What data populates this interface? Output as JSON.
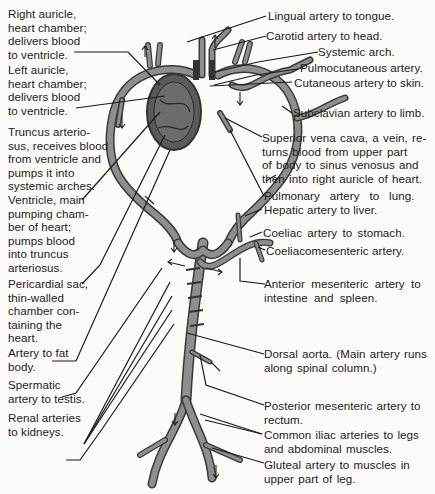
{
  "diagram": {
    "colors": {
      "vessel_outline": "#3a3a3a",
      "vessel_fill": "#8e8e8e",
      "heart_fill": "#5a5a5a",
      "text": "#1c1c1c",
      "background": "#fbfbf9"
    },
    "left_labels": [
      {
        "id": "right-auricle",
        "text": "Right auricle,\nheart chamber;\ndelivers blood\nto ventricle."
      },
      {
        "id": "left-auricle",
        "text": "Left auricle,\nheart chamber;\ndelivers blood\nto ventricle."
      },
      {
        "id": "truncus-arteriosus",
        "text": "Truncus arterio-\nsus, receives blood\nfrom ventricle and\npumps it into\nsystemic arches."
      },
      {
        "id": "ventricle",
        "text": "Ventricle, main\npumping cham-\nber of heart;\npumps blood\ninto truncus\narteriosus."
      },
      {
        "id": "pericardial-sac",
        "text": "Pericardial sac,\nthin-walled\nchamber con-\ntaining the\nheart."
      },
      {
        "id": "artery-fat-body",
        "text": "Artery to fat\nbody."
      },
      {
        "id": "spermatic-artery",
        "text": "Spermatic\nartery to testis."
      },
      {
        "id": "renal-arteries",
        "text": "Renal arteries\nto kidneys."
      }
    ],
    "right_labels": [
      {
        "id": "lingual-artery",
        "text": "Lingual artery to tongue."
      },
      {
        "id": "carotid-artery",
        "text": "Carotid artery to head."
      },
      {
        "id": "systemic-arch",
        "text": "Systemic arch."
      },
      {
        "id": "pulmocutaneous-artery",
        "text": "Pulmocutaneous artery."
      },
      {
        "id": "cutaneous-artery",
        "text": "Cutaneous artery to skin."
      },
      {
        "id": "subclavian-artery",
        "text": "Subclavian artery to limb."
      },
      {
        "id": "superior-vena-cava",
        "text": "Superior vena cava, a vein, re-\nturns blood from upper part\nof body to sinus venosus and\nthen into right auricle of heart."
      },
      {
        "id": "pulmonary-artery",
        "text": "Pulmonary   artery   to   lung."
      },
      {
        "id": "hepatic-artery",
        "text": "Hepatic artery to liver."
      },
      {
        "id": "coeliac-artery",
        "text": "Coeliac artery to stomach."
      },
      {
        "id": "coeliacomesenteric-artery",
        "text": "Coeliacomesenteric artery."
      },
      {
        "id": "anterior-mesenteric-artery",
        "text": "Anterior mesenteric artery to\nintestine and spleen."
      },
      {
        "id": "dorsal-aorta",
        "text": "Dorsal aorta. (Main artery runs\nalong spinal column.)"
      },
      {
        "id": "posterior-mesenteric-artery",
        "text": "Posterior mesenteric artery to\nrectum."
      },
      {
        "id": "common-iliac-arteries",
        "text": "Common iliac arteries to legs\nand abdominal muscles."
      },
      {
        "id": "gluteal-artery",
        "text": "Gluteal artery to muscles in\nupper part of leg."
      }
    ]
  }
}
